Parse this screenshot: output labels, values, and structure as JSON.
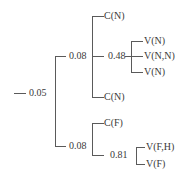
{
  "tree": {
    "root": {
      "value": "0.05",
      "children": [
        {
          "value": "0.08",
          "children": [
            {
              "label": "C(N)"
            },
            {
              "value": "0.48",
              "children": [
                {
                  "label": "V(N)"
                },
                {
                  "label": "V(N,N)"
                },
                {
                  "label": "V(N)"
                }
              ]
            },
            {
              "label": "C(N)"
            }
          ]
        },
        {
          "value": "0.08",
          "children": [
            {
              "label": "C(F)"
            },
            {
              "value": "0.81",
              "children": [
                {
                  "label": "V(F,H)"
                },
                {
                  "label": "V(F)"
                }
              ]
            }
          ]
        }
      ]
    }
  },
  "colors": {
    "line": "#5a5a5a",
    "text": "#3a3a3a",
    "background": "#ffffff"
  }
}
